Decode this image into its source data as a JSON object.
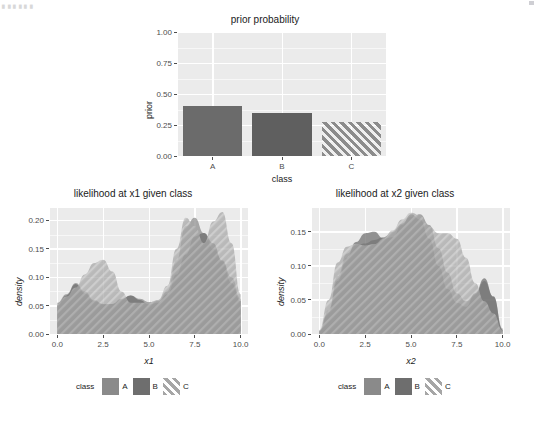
{
  "page": {
    "background": "#ffffff",
    "top_fragment": "▖▖▖▖▖▖",
    "panel_bg": "#ebebeb",
    "grid_color": "#ffffff"
  },
  "palette": {
    "class_a": "#808080",
    "class_b": "#6e6e6e",
    "class_c": "#9e9e9e",
    "bar_a": "#6b6b6b",
    "bar_b": "#5f5f5f",
    "bar_c": "#8c8c8c",
    "axis_text": "#4d4d4d",
    "title_text": "#1a1a1a"
  },
  "legend": {
    "title": "class",
    "entries": [
      {
        "label": "A",
        "color": "#8a8a8a",
        "pattern": "solid"
      },
      {
        "label": "B",
        "color": "#6e6e6e",
        "pattern": "solid"
      },
      {
        "label": "C",
        "color": "#a6a6a6",
        "pattern": "hatch"
      }
    ]
  },
  "chart_data": [
    {
      "id": "prior",
      "type": "bar",
      "title": "prior probability",
      "xlabel": "class",
      "ylabel": "prior",
      "categories": [
        "A",
        "B",
        "C"
      ],
      "values": [
        0.4,
        0.345,
        0.275
      ],
      "ylim": [
        0.0,
        1.0
      ],
      "yticks": [
        "0.00",
        "0.25",
        "0.50",
        "0.75",
        "1.00"
      ],
      "ytick_values": [
        0.0,
        0.25,
        0.5,
        0.75,
        1.0
      ],
      "grid": true,
      "legend": "none",
      "bar_colors": [
        "#6b6b6b",
        "#5f5f5f",
        "#8c8c8c"
      ],
      "bar_patterns": [
        "solid",
        "solid",
        "hatch"
      ]
    },
    {
      "id": "likelihood_x1",
      "type": "area",
      "title": "likelihood at x1 given class",
      "xlabel": "x1",
      "ylabel": "density",
      "xlim": [
        -0.4,
        10.4
      ],
      "ylim": [
        0.0,
        0.222
      ],
      "xticks": [
        "0.0",
        "2.5",
        "5.0",
        "7.5",
        "10.0"
      ],
      "xtick_values": [
        0.0,
        2.5,
        5.0,
        7.5,
        10.0
      ],
      "yticks": [
        "0.00",
        "0.05",
        "0.10",
        "0.15",
        "0.20"
      ],
      "ytick_values": [
        0.0,
        0.05,
        0.1,
        0.15,
        0.2
      ],
      "grid": true,
      "legend": "bottom",
      "series": [
        {
          "name": "A",
          "color": "#8a8a8a",
          "pattern": "solid",
          "points": [
            [
              0.0,
              0.055
            ],
            [
              0.5,
              0.07
            ],
            [
              1.0,
              0.09
            ],
            [
              1.5,
              0.075
            ],
            [
              2.0,
              0.06
            ],
            [
              2.5,
              0.053
            ],
            [
              3.0,
              0.053
            ],
            [
              3.5,
              0.06
            ],
            [
              4.0,
              0.068
            ],
            [
              4.5,
              0.062
            ],
            [
              5.0,
              0.056
            ],
            [
              5.5,
              0.058
            ],
            [
              6.0,
              0.075
            ],
            [
              6.5,
              0.13
            ],
            [
              7.0,
              0.19
            ],
            [
              7.5,
              0.205
            ],
            [
              8.0,
              0.178
            ],
            [
              8.5,
              0.15
            ],
            [
              9.0,
              0.13
            ],
            [
              9.5,
              0.1
            ],
            [
              10.0,
              0.062
            ]
          ]
        },
        {
          "name": "B",
          "color": "#6e6e6e",
          "pattern": "solid",
          "points": [
            [
              0.0,
              0.05
            ],
            [
              0.5,
              0.068
            ],
            [
              1.0,
              0.088
            ],
            [
              1.5,
              0.072
            ],
            [
              2.0,
              0.058
            ],
            [
              2.5,
              0.052
            ],
            [
              3.0,
              0.053
            ],
            [
              3.5,
              0.062
            ],
            [
              4.0,
              0.068
            ],
            [
              4.5,
              0.06
            ],
            [
              5.0,
              0.052
            ],
            [
              5.5,
              0.055
            ],
            [
              6.0,
              0.07
            ],
            [
              6.5,
              0.105
            ],
            [
              7.0,
              0.14
            ],
            [
              7.5,
              0.172
            ],
            [
              8.0,
              0.178
            ],
            [
              8.5,
              0.16
            ],
            [
              9.0,
              0.128
            ],
            [
              9.5,
              0.09
            ],
            [
              10.0,
              0.058
            ]
          ]
        },
        {
          "name": "C",
          "color": "#a6a6a6",
          "pattern": "hatch",
          "points": [
            [
              0.0,
              0.052
            ],
            [
              0.5,
              0.066
            ],
            [
              1.0,
              0.082
            ],
            [
              1.5,
              0.105
            ],
            [
              2.0,
              0.125
            ],
            [
              2.5,
              0.131
            ],
            [
              3.0,
              0.11
            ],
            [
              3.5,
              0.075
            ],
            [
              4.0,
              0.055
            ],
            [
              4.5,
              0.055
            ],
            [
              5.0,
              0.056
            ],
            [
              5.5,
              0.06
            ],
            [
              6.0,
              0.085
            ],
            [
              6.5,
              0.15
            ],
            [
              7.0,
              0.205
            ],
            [
              7.5,
              0.19
            ],
            [
              8.0,
              0.16
            ],
            [
              8.5,
              0.198
            ],
            [
              9.0,
              0.215
            ],
            [
              9.5,
              0.16
            ],
            [
              10.0,
              0.07
            ]
          ]
        }
      ]
    },
    {
      "id": "likelihood_x2",
      "type": "area",
      "title": "likelihood at x2 given class",
      "xlabel": "x2",
      "ylabel": "density",
      "xlim": [
        -0.4,
        10.4
      ],
      "ylim": [
        0.0,
        0.185
      ],
      "xticks": [
        "0.0",
        "2.5",
        "5.0",
        "7.5",
        "10.0"
      ],
      "xtick_values": [
        0.0,
        2.5,
        5.0,
        7.5,
        10.0
      ],
      "yticks": [
        "0.00",
        "0.05",
        "0.10",
        "0.15"
      ],
      "ytick_values": [
        0.0,
        0.05,
        0.1,
        0.15
      ],
      "grid": true,
      "legend": "bottom",
      "series": [
        {
          "name": "A",
          "color": "#8a8a8a",
          "pattern": "solid",
          "points": [
            [
              0.0,
              0.005
            ],
            [
              0.5,
              0.035
            ],
            [
              1.0,
              0.085
            ],
            [
              1.5,
              0.118
            ],
            [
              2.0,
              0.13
            ],
            [
              2.5,
              0.133
            ],
            [
              3.0,
              0.138
            ],
            [
              3.5,
              0.142
            ],
            [
              4.0,
              0.15
            ],
            [
              4.5,
              0.162
            ],
            [
              5.0,
              0.172
            ],
            [
              5.5,
              0.176
            ],
            [
              6.0,
              0.16
            ],
            [
              6.5,
              0.126
            ],
            [
              7.0,
              0.09
            ],
            [
              7.5,
              0.06
            ],
            [
              8.0,
              0.048
            ],
            [
              8.5,
              0.058
            ],
            [
              9.0,
              0.078
            ],
            [
              9.5,
              0.055
            ],
            [
              10.0,
              0.008
            ]
          ]
        },
        {
          "name": "B",
          "color": "#6e6e6e",
          "pattern": "solid",
          "points": [
            [
              0.0,
              0.004
            ],
            [
              0.5,
              0.032
            ],
            [
              1.0,
              0.078
            ],
            [
              1.5,
              0.112
            ],
            [
              2.0,
              0.135
            ],
            [
              2.5,
              0.148
            ],
            [
              3.0,
              0.15
            ],
            [
              3.5,
              0.14
            ],
            [
              4.0,
              0.142
            ],
            [
              4.5,
              0.16
            ],
            [
              5.0,
              0.176
            ],
            [
              5.5,
              0.168
            ],
            [
              6.0,
              0.14
            ],
            [
              6.5,
              0.1
            ],
            [
              7.0,
              0.066
            ],
            [
              7.5,
              0.046
            ],
            [
              8.0,
              0.04
            ],
            [
              8.5,
              0.06
            ],
            [
              9.0,
              0.082
            ],
            [
              9.5,
              0.055
            ],
            [
              10.0,
              0.006
            ]
          ]
        },
        {
          "name": "C",
          "color": "#a6a6a6",
          "pattern": "hatch",
          "points": [
            [
              0.0,
              0.006
            ],
            [
              0.5,
              0.05
            ],
            [
              1.0,
              0.105
            ],
            [
              1.5,
              0.128
            ],
            [
              2.0,
              0.132
            ],
            [
              2.5,
              0.13
            ],
            [
              3.0,
              0.132
            ],
            [
              3.5,
              0.14
            ],
            [
              4.0,
              0.152
            ],
            [
              4.5,
              0.168
            ],
            [
              5.0,
              0.178
            ],
            [
              5.5,
              0.174
            ],
            [
              6.0,
              0.158
            ],
            [
              6.5,
              0.148
            ],
            [
              7.0,
              0.148
            ],
            [
              7.5,
              0.14
            ],
            [
              8.0,
              0.112
            ],
            [
              8.5,
              0.075
            ],
            [
              9.0,
              0.048
            ],
            [
              9.5,
              0.03
            ],
            [
              10.0,
              0.005
            ]
          ]
        }
      ]
    }
  ]
}
